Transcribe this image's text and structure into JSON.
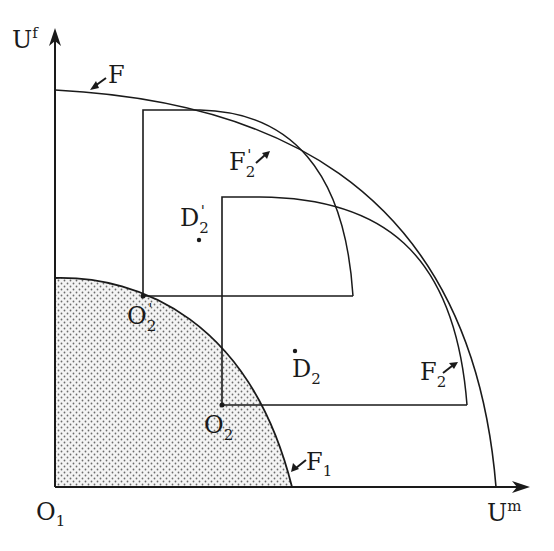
{
  "diagram": {
    "type": "utility-possibility-frontier",
    "axes": {
      "x": {
        "label": "U",
        "superscript": "m"
      },
      "y": {
        "label": "U",
        "superscript": "f"
      }
    },
    "origin": {
      "label": "O",
      "subscript": "1"
    },
    "curves": [
      {
        "id": "F",
        "label": "F",
        "subscript": "",
        "description": "outer frontier"
      },
      {
        "id": "F1",
        "label": "F",
        "subscript": "1",
        "description": "shaded inner frontier"
      },
      {
        "id": "F2prime",
        "label": "F",
        "subscript": "2",
        "prime": "'",
        "description": "frontier from origin O2'"
      },
      {
        "id": "F2",
        "label": "F",
        "subscript": "2",
        "description": "frontier from origin O2"
      }
    ],
    "points": [
      {
        "id": "O2prime",
        "label": "O",
        "subscript": "2",
        "prime": "'"
      },
      {
        "id": "O2",
        "label": "O",
        "subscript": "2"
      },
      {
        "id": "D2prime",
        "label": "D",
        "subscript": "2",
        "prime": "'"
      },
      {
        "id": "D2",
        "label": "D",
        "subscript": "2"
      }
    ],
    "colors": {
      "ink": "#1a1a1a",
      "shade_dot": "#6b6b6b",
      "background": "#ffffff"
    }
  }
}
